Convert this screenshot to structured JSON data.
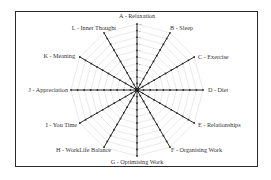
{
  "chart_data": {
    "type": "radar",
    "title": "",
    "categories": [
      "A - Relaxation",
      "B - Sleep",
      "C - Exercise",
      "D - Diet",
      "E - Relationships",
      "F - Organising Work",
      "G - Optimising Work",
      "H - WorkLife Balance",
      "I - You Time",
      "J - Appreciation",
      "K - Meaning",
      "L - Inner Thought"
    ],
    "scale": {
      "min": 0,
      "max": 10,
      "step": 1
    },
    "tick_labels": [
      "1",
      "2",
      "3",
      "4",
      "5",
      "6",
      "7",
      "8",
      "9",
      "10"
    ],
    "series": [],
    "grid": true,
    "legend": "none"
  },
  "colors": {
    "axis": "#2b2b2b",
    "grid": "#d4d4d4",
    "frame": "#2a2a2a",
    "text": "#333333"
  }
}
